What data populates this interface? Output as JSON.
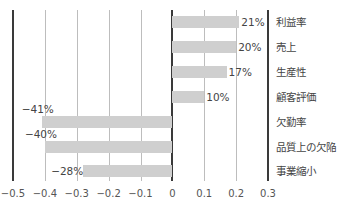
{
  "chart_data": {
    "type": "bar",
    "orientation": "horizontal",
    "title": "",
    "xlabel": "",
    "ylabel": "",
    "xlim": [
      -0.5,
      0.3
    ],
    "grid": true,
    "legend": null,
    "categories": [
      "利益率",
      "売上",
      "生産性",
      "顧客評価",
      "欠勤率",
      "品質上の欠陥",
      "事業縮小"
    ],
    "values": [
      0.21,
      0.2,
      0.17,
      0.1,
      -0.41,
      -0.4,
      -0.28
    ],
    "data_labels": [
      "21%",
      "20%",
      "17%",
      "10%",
      "−41%",
      "−40%",
      "−28%"
    ],
    "x_ticks": [
      "−0.5",
      "−0.4",
      "−0.3",
      "−0.2",
      "−0.1",
      "0",
      "0.1",
      "0.2",
      "0.3"
    ],
    "x_tick_values": [
      -0.5,
      -0.4,
      -0.3,
      -0.2,
      -0.1,
      0,
      0.1,
      0.2,
      0.3
    ],
    "colors": {
      "bar": "#cfcfcf",
      "grid": "#bdbdbd",
      "axis": "#3a3a3a",
      "text": "#444444"
    }
  }
}
